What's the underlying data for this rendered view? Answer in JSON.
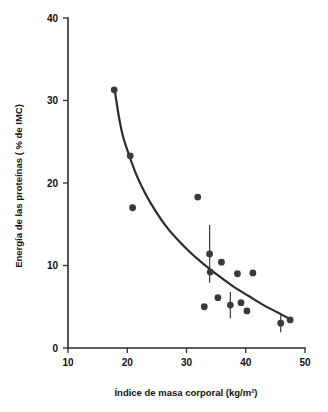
{
  "chart_data": {
    "type": "scatter",
    "title": "",
    "xlabel": "Índice de masa corporal (kg/m²)",
    "ylabel": "Energía de las proteínas ( % de IMC)",
    "xlim": [
      10,
      50
    ],
    "ylim": [
      0,
      40
    ],
    "xticks": [
      10,
      20,
      30,
      40,
      50
    ],
    "yticks": [
      0,
      10,
      20,
      30,
      40
    ],
    "xtick_labels": [
      "10",
      "20",
      "30",
      "40",
      "50"
    ],
    "ytick_labels": [
      "0",
      "10",
      "20",
      "30",
      "40"
    ],
    "grid": false,
    "legend": false,
    "marker": "filled-circle",
    "marker_color": "#3a3a3a",
    "curve_color": "#2b2b2b",
    "axis_color": "#2b2b2b",
    "points": [
      {
        "x": 17.8,
        "y": 31.3,
        "yerr": null
      },
      {
        "x": 20.5,
        "y": 23.3,
        "yerr": null
      },
      {
        "x": 20.9,
        "y": 17.0,
        "yerr": null
      },
      {
        "x": 31.9,
        "y": 18.3,
        "yerr": null
      },
      {
        "x": 33.9,
        "y": 11.4,
        "yerr": 3.5
      },
      {
        "x": 34.0,
        "y": 9.2,
        "yerr": null
      },
      {
        "x": 35.9,
        "y": 10.4,
        "yerr": null
      },
      {
        "x": 38.6,
        "y": 9.0,
        "yerr": null
      },
      {
        "x": 41.2,
        "y": 9.1,
        "yerr": null
      },
      {
        "x": 33.0,
        "y": 5.0,
        "yerr": null
      },
      {
        "x": 35.3,
        "y": 6.1,
        "yerr": null
      },
      {
        "x": 37.4,
        "y": 5.2,
        "yerr": 1.6
      },
      {
        "x": 39.2,
        "y": 5.5,
        "yerr": null
      },
      {
        "x": 40.2,
        "y": 4.5,
        "yerr": null
      },
      {
        "x": 45.9,
        "y": 3.0,
        "yerr": 1.1
      },
      {
        "x": 47.5,
        "y": 3.4,
        "yerr": null
      }
    ],
    "fit_curve": {
      "description": "decaying fitted trend line",
      "points": [
        {
          "x": 17.9,
          "y": 31.2
        },
        {
          "x": 18.6,
          "y": 28.0
        },
        {
          "x": 19.3,
          "y": 25.6
        },
        {
          "x": 20.4,
          "y": 23.2
        },
        {
          "x": 21.6,
          "y": 20.9
        },
        {
          "x": 23.0,
          "y": 18.8
        },
        {
          "x": 24.6,
          "y": 16.8
        },
        {
          "x": 26.4,
          "y": 14.9
        },
        {
          "x": 28.4,
          "y": 13.2
        },
        {
          "x": 30.6,
          "y": 11.6
        },
        {
          "x": 33.0,
          "y": 10.1
        },
        {
          "x": 35.5,
          "y": 8.7
        },
        {
          "x": 38.0,
          "y": 7.4
        },
        {
          "x": 40.5,
          "y": 6.3
        },
        {
          "x": 43.0,
          "y": 5.2
        },
        {
          "x": 45.4,
          "y": 4.3
        },
        {
          "x": 47.5,
          "y": 3.5
        }
      ]
    }
  }
}
